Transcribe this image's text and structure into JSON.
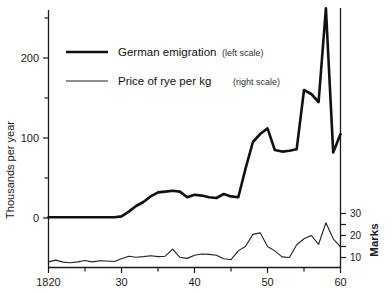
{
  "chart_data": {
    "type": "line",
    "title": "",
    "xlabel": "",
    "ylabel": "Thousands per year",
    "y2label": "Marks",
    "xlim": [
      1820,
      1860
    ],
    "ylim": [
      -60,
      270
    ],
    "y2lim": [
      0,
      36
    ],
    "grid": false,
    "legend_position": "upper-left-inside",
    "x_tick_labels": [
      "1820",
      "30",
      "40",
      "50",
      "60"
    ],
    "x_tick_values": [
      1820,
      1830,
      1840,
      1850,
      1860
    ],
    "x_minor_ticks": [
      1825,
      1835,
      1845,
      1855
    ],
    "y_tick_labels": [
      "0",
      "100",
      "200"
    ],
    "y_tick_values": [
      0,
      100,
      200
    ],
    "y_minor_ticks": [
      50,
      150,
      250
    ],
    "y2_tick_labels": [
      "10",
      "20",
      "30"
    ],
    "y2_tick_values": [
      10,
      20,
      30
    ],
    "x": [
      1820,
      1821,
      1822,
      1823,
      1824,
      1825,
      1826,
      1827,
      1828,
      1829,
      1830,
      1831,
      1832,
      1833,
      1834,
      1835,
      1836,
      1837,
      1838,
      1839,
      1840,
      1841,
      1842,
      1843,
      1844,
      1845,
      1846,
      1847,
      1848,
      1849,
      1850,
      1851,
      1852,
      1853,
      1854,
      1855,
      1856,
      1857,
      1858,
      1859,
      1860
    ],
    "series": [
      {
        "name": "German emigration",
        "scale": "left",
        "unit": "thousands per year",
        "style": "thick",
        "values": [
          1,
          1,
          1,
          1,
          1,
          1,
          1,
          1,
          1,
          1,
          2,
          8,
          15,
          20,
          27,
          32,
          33,
          34,
          33,
          26,
          29,
          28,
          26,
          25,
          30,
          27,
          26,
          62,
          95,
          105,
          112,
          85,
          83,
          84,
          86,
          160,
          155,
          145,
          262,
          82,
          105
        ]
      },
      {
        "name": "Price of rye per kg",
        "scale": "right",
        "unit": "Marks",
        "style": "thin",
        "values": [
          8.0,
          8.8,
          7.9,
          7.6,
          8.0,
          8.6,
          8.0,
          8.5,
          8.4,
          8.2,
          9.4,
          10.6,
          10.1,
          10.4,
          10.8,
          10.4,
          10.6,
          13.8,
          10.1,
          9.6,
          11.0,
          11.6,
          11.4,
          11.0,
          9.4,
          9.0,
          13.0,
          15.1,
          20.5,
          21.2,
          15.0,
          13.0,
          10.3,
          10.0,
          15.8,
          18.5,
          20.0,
          16.0,
          25.8,
          18.5,
          14.8
        ]
      }
    ],
    "annotations": []
  },
  "legend": {
    "items": [
      {
        "label": "German emigration",
        "scale_note": "(left scale)",
        "swatch": "thick-line-swatch"
      },
      {
        "label": "Price of rye per kg",
        "scale_note": "(right scale)",
        "swatch": "thin-line-swatch"
      }
    ]
  },
  "axes": {
    "left_title": "Thousands per year",
    "right_title": "Marks"
  }
}
